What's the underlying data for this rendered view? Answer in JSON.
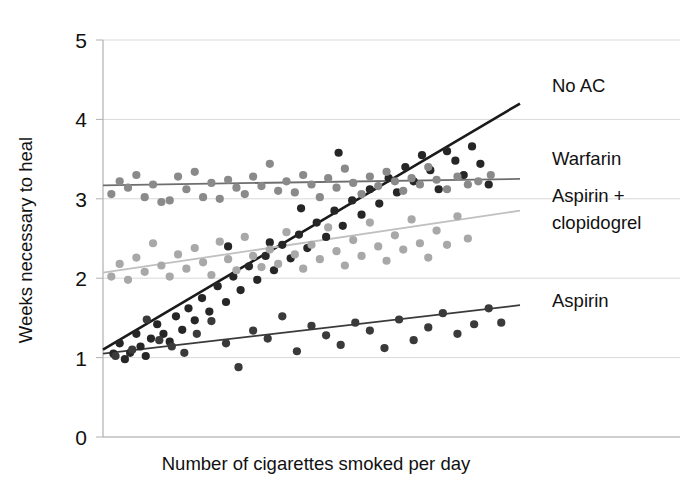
{
  "chart_data": {
    "type": "scatter",
    "title": "",
    "xlabel": "Number of cigarettes smoked per day",
    "ylabel": "Weeks necessary to heal",
    "xlim": [
      0,
      40
    ],
    "ylim": [
      0,
      5
    ],
    "yticks": [
      "0",
      "1",
      "2",
      "3",
      "4",
      "5"
    ],
    "xticks": [],
    "grid": "horizontal",
    "legend_position": "right-inline-labels",
    "series": [
      {
        "name": "No AC",
        "label": "No AC",
        "color": "#262626",
        "line_color": "#1a1a1a",
        "fit_start": [
          0,
          1.1
        ],
        "fit_end": [
          40,
          4.2
        ],
        "points": [
          [
            1.0,
            1.05
          ],
          [
            1.6,
            1.18
          ],
          [
            2.1,
            0.98
          ],
          [
            2.6,
            1.06
          ],
          [
            3.2,
            1.3
          ],
          [
            3.6,
            1.14
          ],
          [
            4.1,
            1.02
          ],
          [
            4.6,
            1.24
          ],
          [
            5.2,
            1.42
          ],
          [
            5.8,
            1.3
          ],
          [
            6.4,
            1.2
          ],
          [
            7.0,
            1.52
          ],
          [
            7.6,
            1.35
          ],
          [
            8.2,
            1.62
          ],
          [
            8.8,
            1.47
          ],
          [
            9.5,
            1.75
          ],
          [
            10.2,
            1.58
          ],
          [
            11.0,
            1.9
          ],
          [
            11.8,
            1.7
          ],
          [
            12.5,
            2.02
          ],
          [
            13.2,
            1.85
          ],
          [
            14.0,
            2.15
          ],
          [
            14.8,
            1.98
          ],
          [
            15.6,
            2.28
          ],
          [
            16.4,
            2.1
          ],
          [
            17.2,
            2.42
          ],
          [
            18.0,
            2.25
          ],
          [
            18.8,
            2.55
          ],
          [
            19.6,
            2.38
          ],
          [
            20.5,
            2.7
          ],
          [
            21.4,
            2.52
          ],
          [
            22.2,
            2.85
          ],
          [
            23.0,
            2.66
          ],
          [
            23.9,
            2.98
          ],
          [
            24.8,
            2.8
          ],
          [
            25.6,
            3.12
          ],
          [
            26.5,
            2.94
          ],
          [
            27.4,
            3.26
          ],
          [
            28.2,
            3.08
          ],
          [
            29.0,
            3.4
          ],
          [
            29.8,
            3.22
          ],
          [
            30.6,
            3.55
          ],
          [
            31.4,
            3.36
          ],
          [
            32.2,
            3.12
          ],
          [
            33.0,
            3.6
          ],
          [
            33.8,
            3.48
          ],
          [
            34.6,
            3.3
          ],
          [
            35.4,
            3.66
          ],
          [
            36.2,
            3.44
          ],
          [
            37.0,
            3.18
          ],
          [
            22.6,
            3.58
          ],
          [
            19.0,
            2.88
          ],
          [
            16.0,
            2.45
          ],
          [
            12.0,
            2.4
          ]
        ]
      },
      {
        "name": "Warfarin",
        "label": "Warfarin",
        "color": "#8a8a8a",
        "line_color": "#6e6e6e",
        "fit_start": [
          0,
          3.17
        ],
        "fit_end": [
          40,
          3.25
        ],
        "points": [
          [
            0.8,
            3.06
          ],
          [
            1.6,
            3.22
          ],
          [
            2.4,
            3.14
          ],
          [
            3.2,
            3.3
          ],
          [
            4.0,
            3.02
          ],
          [
            4.8,
            3.18
          ],
          [
            5.6,
            2.96
          ],
          [
            6.4,
            2.98
          ],
          [
            7.2,
            3.28
          ],
          [
            8.0,
            3.12
          ],
          [
            8.8,
            3.34
          ],
          [
            9.6,
            3.02
          ],
          [
            10.4,
            3.2
          ],
          [
            11.2,
            3.0
          ],
          [
            12.0,
            3.24
          ],
          [
            12.8,
            3.14
          ],
          [
            13.6,
            3.06
          ],
          [
            14.4,
            3.28
          ],
          [
            15.2,
            3.16
          ],
          [
            16.0,
            3.44
          ],
          [
            16.8,
            3.1
          ],
          [
            17.6,
            3.22
          ],
          [
            18.4,
            3.08
          ],
          [
            19.2,
            3.3
          ],
          [
            20.0,
            3.18
          ],
          [
            20.8,
            3.02
          ],
          [
            21.6,
            3.26
          ],
          [
            22.4,
            3.14
          ],
          [
            23.2,
            3.38
          ],
          [
            24.0,
            3.2
          ],
          [
            24.8,
            3.06
          ],
          [
            25.6,
            3.28
          ],
          [
            26.4,
            3.16
          ],
          [
            27.2,
            3.34
          ],
          [
            28.0,
            3.22
          ],
          [
            28.8,
            3.1
          ],
          [
            29.6,
            3.26
          ],
          [
            30.4,
            3.18
          ],
          [
            31.2,
            3.4
          ],
          [
            32.0,
            3.24
          ],
          [
            33.0,
            3.12
          ],
          [
            34.0,
            3.28
          ],
          [
            35.0,
            3.18
          ],
          [
            36.0,
            3.22
          ],
          [
            37.2,
            3.3
          ]
        ]
      },
      {
        "name": "Aspirin + clopidogrel",
        "label_line1": "Aspirin +",
        "label_line2": "clopidogrel",
        "color": "#a8a8a8",
        "line_color": "#c0c0c0",
        "fit_start": [
          0,
          2.07
        ],
        "fit_end": [
          40,
          2.85
        ],
        "points": [
          [
            0.8,
            2.02
          ],
          [
            1.6,
            2.18
          ],
          [
            2.4,
            1.98
          ],
          [
            3.2,
            2.26
          ],
          [
            4.0,
            2.08
          ],
          [
            4.8,
            2.44
          ],
          [
            5.6,
            2.16
          ],
          [
            6.4,
            2.02
          ],
          [
            7.2,
            2.3
          ],
          [
            8.0,
            2.12
          ],
          [
            8.8,
            2.38
          ],
          [
            9.6,
            2.2
          ],
          [
            10.4,
            2.04
          ],
          [
            11.2,
            2.46
          ],
          [
            12.0,
            2.24
          ],
          [
            12.8,
            2.1
          ],
          [
            13.6,
            2.52
          ],
          [
            14.4,
            2.28
          ],
          [
            15.2,
            2.14
          ],
          [
            16.0,
            2.36
          ],
          [
            16.8,
            2.18
          ],
          [
            17.6,
            2.58
          ],
          [
            18.4,
            2.3
          ],
          [
            19.2,
            2.12
          ],
          [
            20.0,
            2.42
          ],
          [
            20.8,
            2.24
          ],
          [
            21.6,
            2.64
          ],
          [
            22.4,
            2.34
          ],
          [
            23.2,
            2.16
          ],
          [
            24.0,
            2.48
          ],
          [
            24.8,
            2.28
          ],
          [
            25.6,
            2.7
          ],
          [
            26.4,
            2.4
          ],
          [
            27.2,
            2.22
          ],
          [
            28.0,
            2.54
          ],
          [
            28.8,
            2.36
          ],
          [
            29.6,
            2.74
          ],
          [
            30.4,
            2.44
          ],
          [
            31.2,
            2.26
          ],
          [
            32.0,
            2.6
          ],
          [
            33.0,
            2.42
          ],
          [
            34.0,
            2.78
          ],
          [
            35.0,
            2.5
          ]
        ]
      },
      {
        "name": "Aspirin",
        "label": "Aspirin",
        "color": "#3a3a3a",
        "line_color": "#3a3a3a",
        "fit_start": [
          0,
          1.05
        ],
        "fit_end": [
          40,
          1.66
        ],
        "points": [
          [
            1.2,
            1.02
          ],
          [
            2.8,
            1.1
          ],
          [
            4.2,
            1.48
          ],
          [
            5.4,
            1.22
          ],
          [
            6.6,
            1.14
          ],
          [
            7.8,
            1.06
          ],
          [
            9.0,
            1.3
          ],
          [
            10.4,
            1.46
          ],
          [
            11.8,
            1.18
          ],
          [
            13.0,
            0.88
          ],
          [
            14.4,
            1.34
          ],
          [
            15.8,
            1.24
          ],
          [
            17.2,
            1.52
          ],
          [
            18.6,
            1.08
          ],
          [
            20.0,
            1.4
          ],
          [
            21.4,
            1.28
          ],
          [
            22.8,
            1.16
          ],
          [
            24.2,
            1.44
          ],
          [
            25.6,
            1.34
          ],
          [
            27.0,
            1.12
          ],
          [
            28.4,
            1.48
          ],
          [
            29.8,
            1.22
          ],
          [
            31.2,
            1.38
          ],
          [
            32.6,
            1.56
          ],
          [
            34.0,
            1.3
          ],
          [
            35.6,
            1.42
          ],
          [
            37.0,
            1.62
          ],
          [
            38.2,
            1.44
          ]
        ]
      }
    ],
    "annotations": [
      {
        "name": "no-ac-label",
        "text": "No AC",
        "x": 552,
        "y": 92
      },
      {
        "name": "warfarin-label",
        "text": "Warfarin",
        "x": 552,
        "y": 165
      },
      {
        "name": "aspirin-clopidogrel-label-1",
        "text": "Aspirin +",
        "x": 552,
        "y": 202
      },
      {
        "name": "aspirin-clopidogrel-label-2",
        "text": "clopidogrel",
        "x": 552,
        "y": 229
      },
      {
        "name": "aspirin-label",
        "text": "Aspirin",
        "x": 552,
        "y": 307
      }
    ],
    "colors": {
      "gridline": "#d9d9d9",
      "axis": "#b0b0b0",
      "background": "#ffffff",
      "text": "#111111"
    }
  }
}
